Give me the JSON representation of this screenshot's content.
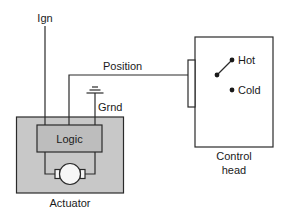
{
  "diagram": {
    "type": "wiring-schematic",
    "labels": {
      "ignition": "Ign",
      "position": "Position",
      "ground": "Grnd",
      "logic": "Logic",
      "actuator": "Actuator",
      "hot": "Hot",
      "cold": "Cold",
      "control_head_line1": "Control",
      "control_head_line2": "head"
    },
    "colors": {
      "actuator_fill": "#c8c8c8",
      "logic_fill": "#bdbdbd",
      "stroke": "#2a2a2a",
      "background": "#ffffff"
    },
    "nodes": [
      {
        "id": "actuator",
        "label": "Actuator"
      },
      {
        "id": "logic",
        "label": "Logic",
        "parent": "actuator"
      },
      {
        "id": "motor",
        "parent": "actuator"
      },
      {
        "id": "control-head",
        "label": "Control head"
      },
      {
        "id": "switch",
        "parent": "control-head",
        "positions": [
          "Hot",
          "Cold"
        ],
        "selected": "Hot"
      }
    ],
    "edges": [
      {
        "from": "Ign",
        "to": "logic"
      },
      {
        "from": "switch",
        "to": "logic",
        "label": "Position"
      },
      {
        "from": "Grnd",
        "to": "logic"
      },
      {
        "from": "logic",
        "to": "motor"
      }
    ]
  }
}
